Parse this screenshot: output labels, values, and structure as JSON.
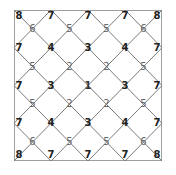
{
  "diagram": {
    "type": "diamond-lattice-grid",
    "frame": {
      "left": 14,
      "top": 10,
      "right": 162,
      "bottom": 161
    },
    "columns": 4,
    "rows": 4,
    "line_color": "#7a7a7a",
    "border_color": "#6a6a6a",
    "rows_of_labels": [
      {
        "kind": "edge",
        "values": [
          "8",
          "7",
          "7",
          "7",
          "8"
        ]
      },
      {
        "kind": "inner",
        "values": [
          "6",
          "5",
          "5",
          "6"
        ]
      },
      {
        "kind": "edge",
        "values": [
          "7",
          "4",
          "3",
          "4",
          "7"
        ]
      },
      {
        "kind": "inner",
        "values": [
          "5",
          "2",
          "2",
          "5"
        ]
      },
      {
        "kind": "edge",
        "values": [
          "7",
          "3",
          "1",
          "3",
          "7"
        ]
      },
      {
        "kind": "inner",
        "values": [
          "5",
          "2",
          "2",
          "5"
        ]
      },
      {
        "kind": "edge",
        "values": [
          "7",
          "4",
          "3",
          "4",
          "7"
        ]
      },
      {
        "kind": "inner",
        "values": [
          "6",
          "5",
          "5",
          "6"
        ]
      },
      {
        "kind": "edge",
        "values": [
          "8",
          "7",
          "7",
          "7",
          "8"
        ]
      }
    ]
  }
}
